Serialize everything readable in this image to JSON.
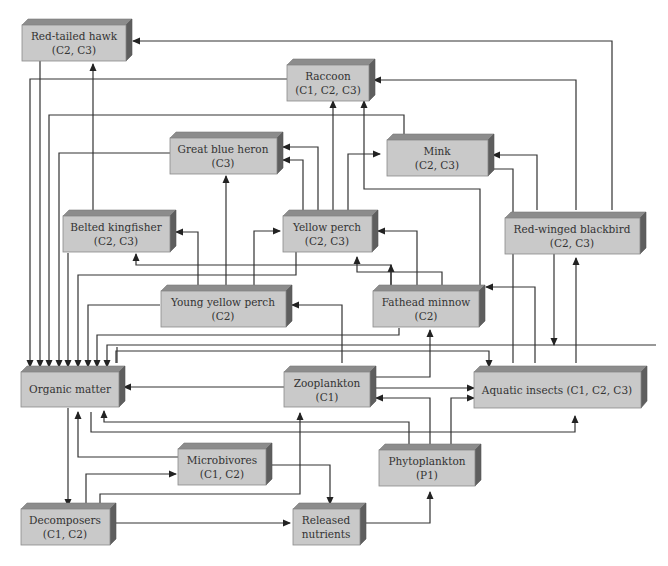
{
  "diagram": {
    "type": "food-web",
    "nodes": [
      {
        "id": "red_tailed_hawk",
        "label": "Red-tailed hawk",
        "sub": "(C2, C3)"
      },
      {
        "id": "raccoon",
        "label": "Raccoon",
        "sub": "(C1, C2, C3)"
      },
      {
        "id": "great_blue_heron",
        "label": "Great blue heron",
        "sub": "(C3)"
      },
      {
        "id": "mink",
        "label": "Mink",
        "sub": "(C2, C3)"
      },
      {
        "id": "belted_kingfisher",
        "label": "Belted kingfisher",
        "sub": "(C2, C3)"
      },
      {
        "id": "yellow_perch",
        "label": "Yellow perch",
        "sub": "(C2, C3)"
      },
      {
        "id": "red_winged_blackbird",
        "label": "Red-winged blackbird",
        "sub": "(C2, C3)"
      },
      {
        "id": "young_yellow_perch",
        "label": "Young yellow perch",
        "sub": "(C2)"
      },
      {
        "id": "fathead_minnow",
        "label": "Fathead minnow",
        "sub": "(C2)"
      },
      {
        "id": "organic_matter",
        "label": "Organic matter",
        "sub": ""
      },
      {
        "id": "zooplankton",
        "label": "Zooplankton",
        "sub": "(C1)"
      },
      {
        "id": "aquatic_insects",
        "label": "Aquatic insects (C1, C2, C3)",
        "sub": ""
      },
      {
        "id": "microbivores",
        "label": "Microbivores",
        "sub": "(C1, C2)"
      },
      {
        "id": "phytoplankton",
        "label": "Phytoplankton",
        "sub": "(P1)"
      },
      {
        "id": "decomposers",
        "label": "Decomposers",
        "sub": "(C1, C2)"
      },
      {
        "id": "released_nutrients",
        "label": "Released",
        "sub": "nutrients"
      }
    ],
    "edges": [
      {
        "from": "red_winged_blackbird",
        "to": "red_tailed_hawk"
      },
      {
        "from": "belted_kingfisher",
        "to": "red_tailed_hawk"
      },
      {
        "from": "red_winged_blackbird",
        "to": "raccoon"
      },
      {
        "from": "yellow_perch",
        "to": "raccoon"
      },
      {
        "from": "fathead_minnow",
        "to": "raccoon"
      },
      {
        "from": "yellow_perch",
        "to": "great_blue_heron"
      },
      {
        "from": "young_yellow_perch",
        "to": "great_blue_heron"
      },
      {
        "from": "yellow_perch",
        "to": "mink"
      },
      {
        "from": "red_winged_blackbird",
        "to": "mink"
      },
      {
        "from": "young_yellow_perch",
        "to": "belted_kingfisher"
      },
      {
        "from": "fathead_minnow",
        "to": "belted_kingfisher"
      },
      {
        "from": "young_yellow_perch",
        "to": "yellow_perch"
      },
      {
        "from": "fathead_minnow",
        "to": "yellow_perch"
      },
      {
        "from": "aquatic_insects",
        "to": "yellow_perch"
      },
      {
        "from": "aquatic_insects",
        "to": "red_winged_blackbird"
      },
      {
        "from": "zooplankton",
        "to": "young_yellow_perch"
      },
      {
        "from": "zooplankton",
        "to": "fathead_minnow"
      },
      {
        "from": "aquatic_insects",
        "to": "fathead_minnow"
      },
      {
        "from": "zooplankton",
        "to": "organic_matter"
      },
      {
        "from": "zooplankton",
        "to": "aquatic_insects"
      },
      {
        "from": "phytoplankton",
        "to": "zooplankton"
      },
      {
        "from": "phytoplankton",
        "to": "aquatic_insects"
      },
      {
        "from": "phytoplankton",
        "to": "organic_matter"
      },
      {
        "from": "organic_matter",
        "to": "aquatic_insects"
      },
      {
        "from": "organic_matter",
        "to": "decomposers"
      },
      {
        "from": "microbivores",
        "to": "organic_matter"
      },
      {
        "from": "microbivores",
        "to": "released_nutrients"
      },
      {
        "from": "decomposers",
        "to": "microbivores"
      },
      {
        "from": "decomposers",
        "to": "zooplankton"
      },
      {
        "from": "decomposers",
        "to": "released_nutrients"
      },
      {
        "from": "released_nutrients",
        "to": "phytoplankton"
      },
      {
        "from": "red_tailed_hawk",
        "to": "organic_matter"
      },
      {
        "from": "raccoon",
        "to": "organic_matter"
      },
      {
        "from": "great_blue_heron",
        "to": "organic_matter"
      },
      {
        "from": "mink",
        "to": "organic_matter"
      },
      {
        "from": "belted_kingfisher",
        "to": "organic_matter"
      },
      {
        "from": "yellow_perch",
        "to": "organic_matter"
      },
      {
        "from": "young_yellow_perch",
        "to": "organic_matter"
      },
      {
        "from": "fathead_minnow",
        "to": "organic_matter"
      },
      {
        "from": "red_winged_blackbird",
        "to": "organic_matter"
      },
      {
        "from": "aquatic_insects",
        "to": "organic_matter"
      }
    ]
  }
}
